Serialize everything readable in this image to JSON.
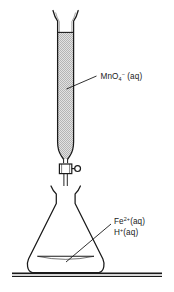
{
  "figure": {
    "background_color": "#ffffff",
    "line_color": "#1a1a1a",
    "fill_color": "#cfcfcf"
  },
  "labels": {
    "burette_reagent": {
      "species": "MnO",
      "subscript": "4",
      "charge": "−",
      "state": "(aq)",
      "full_text": "MnO4−(aq)"
    },
    "flask_reagent_1": {
      "species": "Fe",
      "charge": "2+",
      "state": "(aq)",
      "full_text": "Fe2+(aq)"
    },
    "flask_reagent_2": {
      "species": "H",
      "charge": "+",
      "state": "(aq)",
      "full_text": "H+(aq)"
    }
  },
  "apparatus": {
    "burette": {
      "name": "burette",
      "liquid_name": "permanganate-solution",
      "liquid_fill": "stipple-gray"
    },
    "stopcock": {
      "name": "stopcock",
      "handle": "knob"
    },
    "flask": {
      "name": "conical-flask",
      "liquid_name": "iron-acid-solution"
    },
    "bench": {
      "name": "bench-surface"
    }
  }
}
